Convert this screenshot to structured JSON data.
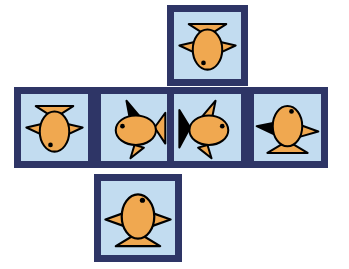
{
  "figure": {
    "kind": "cube-net",
    "shape": "cross",
    "background_color": "#ffffff",
    "face_fill_color": "#c2dcf0",
    "face_border_color": "#2e3566",
    "face_border_width_px": 7,
    "fish_body_color": "#f0a850",
    "fish_outline_color": "#000000",
    "fish_fin_dark_color": "#000000",
    "fish_eye_color": "#000000",
    "face_count": 6,
    "canvas_width_px": 349,
    "canvas_height_px": 269
  },
  "faces": [
    {
      "id": "top",
      "position_label": "top",
      "icon": "fish-icon",
      "fish_direction": "down",
      "dark_fin": "none",
      "x": 167,
      "y": 5,
      "size": 81
    },
    {
      "id": "left-1",
      "position_label": "middle-row-1",
      "icon": "fish-icon",
      "fish_direction": "down",
      "dark_fin": "none",
      "x": 14,
      "y": 87,
      "size": 81
    },
    {
      "id": "left-2",
      "position_label": "middle-row-2",
      "icon": "fish-icon",
      "fish_direction": "left",
      "dark_fin": "dorsal",
      "x": 94,
      "y": 87,
      "size": 81
    },
    {
      "id": "center",
      "position_label": "middle-row-3",
      "icon": "fish-icon",
      "fish_direction": "right",
      "dark_fin": "tail",
      "x": 167,
      "y": 87,
      "size": 81
    },
    {
      "id": "right",
      "position_label": "middle-row-4",
      "icon": "fish-icon",
      "fish_direction": "up",
      "dark_fin": "left-pectoral",
      "x": 247,
      "y": 87,
      "size": 81
    },
    {
      "id": "bottom",
      "position_label": "bottom",
      "icon": "fish-icon",
      "fish_direction": "up",
      "dark_fin": "none",
      "x": 94,
      "y": 174,
      "size": 88
    }
  ]
}
